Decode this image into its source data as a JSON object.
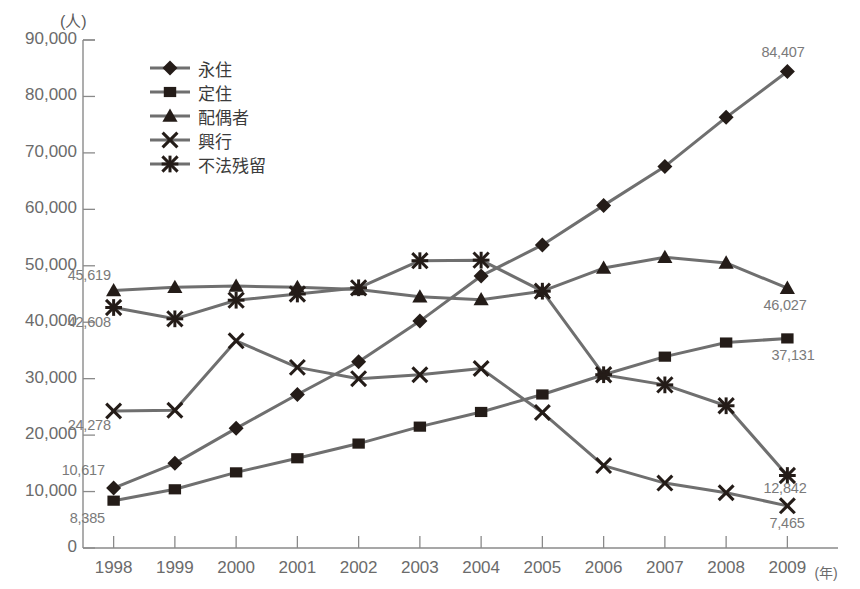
{
  "chart_data": {
    "type": "line",
    "title": "",
    "xlabel": "(年)",
    "ylabel": "(人)",
    "unit_label": "(人)",
    "x_unit_suffix": "(年)",
    "grid": false,
    "legend_position": "top-left-inside",
    "xlim": [
      1998,
      2009
    ],
    "ylim": [
      0,
      90000
    ],
    "ytick_step": 10000,
    "categories": [
      "1998",
      "1999",
      "2000",
      "2001",
      "2002",
      "2003",
      "2004",
      "2005",
      "2006",
      "2007",
      "2008",
      "2009"
    ],
    "ytick_labels": [
      "0",
      "10,000",
      "20,000",
      "30,000",
      "40,000",
      "50,000",
      "60,000",
      "70,000",
      "80,000",
      "90,000"
    ],
    "series": [
      {
        "name": "永住",
        "marker": "diamond",
        "values": [
          10617,
          15000,
          21200,
          27200,
          33000,
          40200,
          48200,
          53700,
          60700,
          67600,
          76300,
          84407
        ]
      },
      {
        "name": "定住",
        "marker": "square",
        "values": [
          8385,
          10400,
          13400,
          15900,
          18500,
          21500,
          24100,
          27200,
          30700,
          33900,
          36400,
          37131
        ]
      },
      {
        "name": "配偶者",
        "marker": "triangle",
        "values": [
          45619,
          46200,
          46400,
          46200,
          45800,
          44500,
          44000,
          45500,
          49600,
          51500,
          50500,
          46027
        ]
      },
      {
        "name": "興行",
        "marker": "x",
        "values": [
          24278,
          24400,
          36700,
          32000,
          30000,
          30700,
          31800,
          24000,
          14600,
          11500,
          9800,
          7465
        ]
      },
      {
        "name": "不法残留",
        "marker": "asterisk",
        "values": [
          42608,
          40600,
          43900,
          45000,
          46100,
          50900,
          51000,
          45500,
          30700,
          28900,
          25200,
          12842
        ]
      }
    ],
    "annotations": [
      {
        "text": "45,619",
        "series": "配偶者",
        "year": "1998",
        "position": "above-left"
      },
      {
        "text": "42,608",
        "series": "不法残留",
        "year": "1998",
        "position": "below-left"
      },
      {
        "text": "24,278",
        "series": "興行",
        "year": "1998",
        "position": "below-left"
      },
      {
        "text": "10,617",
        "series": "永住",
        "year": "1998",
        "position": "above-left"
      },
      {
        "text": "8,385",
        "series": "定住",
        "year": "1998",
        "position": "below-left"
      },
      {
        "text": "84,407",
        "series": "永住",
        "year": "2009",
        "position": "above"
      },
      {
        "text": "46,027",
        "series": "配偶者",
        "year": "2009",
        "position": "below"
      },
      {
        "text": "37,131",
        "series": "定住",
        "year": "2009",
        "position": "below"
      },
      {
        "text": "12,842",
        "series": "不法残留",
        "year": "2009",
        "position": "below"
      },
      {
        "text": "7,465",
        "series": "興行",
        "year": "2009",
        "position": "below"
      }
    ],
    "colors": {
      "line": "#6f6f6f",
      "marker": "#241c18",
      "axis": "#8a8a8a",
      "text": "#6b6b6b",
      "background": "#ffffff"
    }
  }
}
